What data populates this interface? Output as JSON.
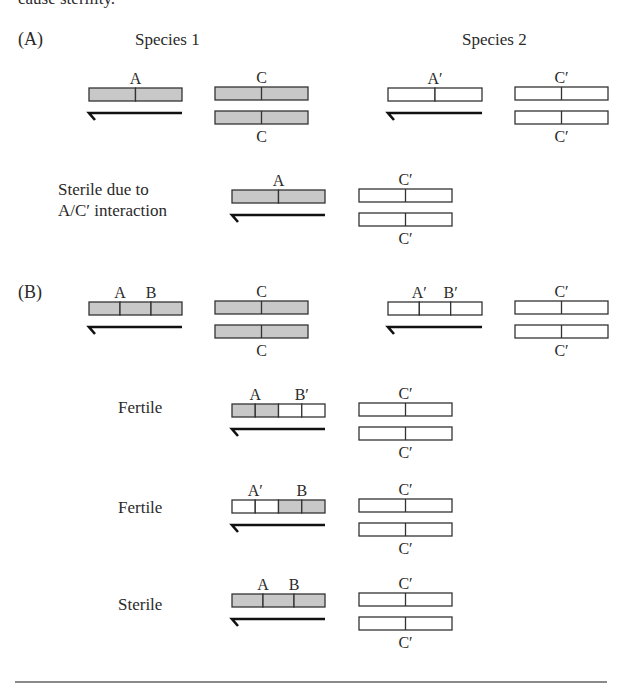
{
  "colors": {
    "species1_fill": "#c8c8c8",
    "species2_fill": "#ffffff",
    "stroke": "#333333",
    "rule": "#8a8a8a"
  },
  "header": {
    "partial_text": "cause sterility.",
    "species1": "Species 1",
    "species2": "Species 2"
  },
  "panels": [
    {
      "id": "A",
      "label": "(A)",
      "label_pos": [
        18,
        45
      ],
      "groups": [
        {
          "name": "species1-parent",
          "chromatid": {
            "x": 89,
            "y": 88,
            "w": 93,
            "segments": [
              1,
              1
            ],
            "labels": [
              {
                "t": "A",
                "at": 0.5
              }
            ],
            "arrow": true
          },
          "pair": {
            "x": 215,
            "w": 93,
            "top_label": "C",
            "bottom_label": "C",
            "species": 1
          }
        },
        {
          "name": "species2-parent",
          "chromatid": {
            "x": 388,
            "y": 88,
            "w": 94,
            "segments": [
              2,
              2
            ],
            "labels": [
              {
                "t": "A′",
                "at": 0.5
              }
            ],
            "arrow": true
          },
          "pair": {
            "x": 515,
            "w": 93,
            "top_label": "C′",
            "bottom_label": "C′",
            "species": 2
          }
        }
      ],
      "hybrids": [
        {
          "label_lines": [
            "Sterile due to",
            "A/C′ interaction"
          ],
          "label_pos": [
            58,
            195
          ],
          "chromatid": {
            "x": 232,
            "y": 190,
            "w": 93,
            "segments": [
              1,
              1
            ],
            "labels": [
              {
                "t": "A",
                "at": 0.5
              }
            ]
          },
          "pair": {
            "x": 359,
            "w": 93,
            "top_label": "C′",
            "bottom_label": "C′",
            "species": 2
          }
        }
      ]
    },
    {
      "id": "B",
      "label": "(B)",
      "label_pos": [
        18,
        298
      ],
      "groups": [
        {
          "name": "species1-parent",
          "chromatid": {
            "x": 89,
            "y": 302,
            "w": 93,
            "segments": [
              1,
              1,
              1
            ],
            "labels": [
              {
                "t": "A",
                "at": 0.333
              },
              {
                "t": "B",
                "at": 0.667
              }
            ],
            "arrow": true
          },
          "pair": {
            "x": 215,
            "w": 93,
            "top_label": "C",
            "bottom_label": "C",
            "species": 1
          }
        },
        {
          "name": "species2-parent",
          "chromatid": {
            "x": 388,
            "y": 302,
            "w": 94,
            "segments": [
              2,
              2,
              2
            ],
            "labels": [
              {
                "t": "A′",
                "at": 0.333
              },
              {
                "t": "B′",
                "at": 0.667
              }
            ],
            "arrow": true
          },
          "pair": {
            "x": 515,
            "w": 93,
            "top_label": "C′",
            "bottom_label": "C′",
            "species": 2
          }
        }
      ],
      "hybrids": [
        {
          "label_lines": [
            "Fertile"
          ],
          "label_pos": [
            118,
            413
          ],
          "chromatid": {
            "x": 232,
            "y": 404,
            "w": 93,
            "segments": [
              1,
              1,
              2,
              2
            ],
            "labels": [
              {
                "t": "A",
                "at": 0.25
              },
              {
                "t": "B′",
                "at": 0.75
              }
            ]
          },
          "pair": {
            "x": 359,
            "w": 93,
            "top_label": "C′",
            "bottom_label": "C′",
            "species": 2
          }
        },
        {
          "label_lines": [
            "Fertile"
          ],
          "label_pos": [
            118,
            513
          ],
          "chromatid": {
            "x": 232,
            "y": 500,
            "w": 93,
            "segments": [
              2,
              2,
              1,
              1
            ],
            "labels": [
              {
                "t": "A′",
                "at": 0.25
              },
              {
                "t": "B",
                "at": 0.75
              }
            ]
          },
          "pair": {
            "x": 359,
            "w": 93,
            "top_label": "C′",
            "bottom_label": "C′",
            "species": 2
          }
        },
        {
          "label_lines": [
            "Sterile"
          ],
          "label_pos": [
            118,
            610
          ],
          "chromatid": {
            "x": 232,
            "y": 594,
            "w": 93,
            "segments": [
              1,
              1,
              1
            ],
            "labels": [
              {
                "t": "A",
                "at": 0.333
              },
              {
                "t": "B",
                "at": 0.667
              }
            ]
          },
          "pair": {
            "x": 359,
            "w": 93,
            "top_label": "C′",
            "bottom_label": "C′",
            "species": 2
          }
        }
      ]
    }
  ],
  "bottom_rule": {
    "x1": 15,
    "x2": 607,
    "y": 682
  }
}
